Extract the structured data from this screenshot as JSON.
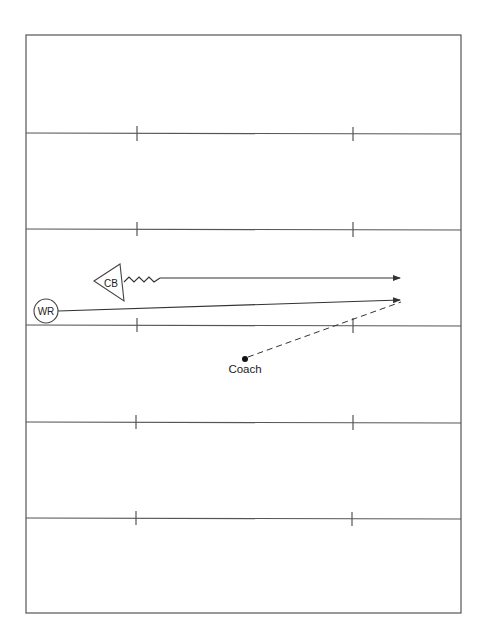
{
  "diagram": {
    "type": "football-drill",
    "field": {
      "border": {
        "x1": 26,
        "y1": 35,
        "x2": 461,
        "y2": 613
      },
      "yard_lines_y": [
        133,
        229,
        326,
        422,
        518
      ],
      "hash_marks_x": [
        137,
        353
      ],
      "line_color": "#555555"
    },
    "players": {
      "wr": {
        "label": "WR",
        "shape": "circle",
        "cx": 46,
        "cy": 311,
        "r": 12
      },
      "cb": {
        "label": "CB",
        "shape": "triangle",
        "points": "94,281 120,264 124,301"
      },
      "coach": {
        "label": "Coach",
        "shape": "dot",
        "cx": 245,
        "cy": 359
      }
    },
    "routes": [
      {
        "from": "CB",
        "style": "zigzag-then-solid-arrow",
        "end": [
          400,
          278
        ]
      },
      {
        "from": "WR",
        "style": "solid-arrow",
        "end": [
          400,
          300
        ]
      },
      {
        "from": "Coach",
        "style": "dashed",
        "end": [
          400,
          302
        ],
        "meaning": "pass"
      }
    ]
  }
}
